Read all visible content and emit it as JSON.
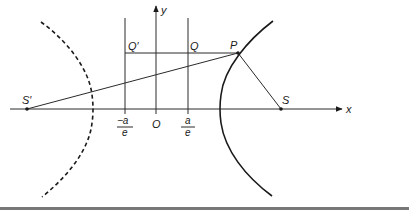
{
  "diagram": {
    "labels": {
      "y_axis": "y",
      "x_axis": "x",
      "origin": "O",
      "Q_prime": "Q′",
      "Q": "Q",
      "P": "P",
      "S": "S",
      "S_prime": "S′",
      "neg_a_over_e_num": "−a",
      "neg_a_over_e_den": "e",
      "a_over_e_num": "a",
      "a_over_e_den": "e"
    },
    "colors": {
      "ink": "#1a1a1a",
      "rule": "#888888",
      "background": "#ffffff"
    },
    "elements": {
      "right_branch": "solid",
      "left_branch": "dashed",
      "directrix_left": "x = -a/e",
      "directrix_right": "x = a/e"
    }
  }
}
